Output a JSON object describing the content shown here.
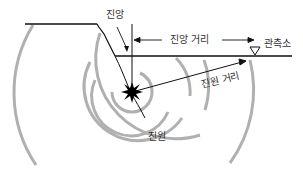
{
  "diagram": {
    "labels": {
      "epicenter": "진앙",
      "epicentral_distance": "진앙 거리",
      "station": "관측소",
      "hypocentral_distance": "진원 거리",
      "hypocenter": "진원"
    },
    "colors": {
      "line": "#111111",
      "wave_rings": "#b0b0b0",
      "text": "#333333",
      "background": "#ffffff"
    }
  }
}
